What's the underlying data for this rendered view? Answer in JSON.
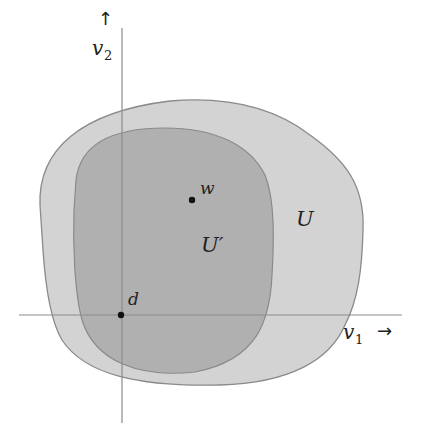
{
  "diagram": {
    "regions": [
      {
        "id": "U",
        "label": "U",
        "fill": "#d2d2d2",
        "stroke": "#8a8a8a"
      },
      {
        "id": "U_prime",
        "label": "U′",
        "fill": "#aeaeae",
        "stroke": "#888888"
      }
    ],
    "points": [
      {
        "id": "w",
        "label": "w"
      },
      {
        "id": "d",
        "label": "d"
      }
    ],
    "axes": {
      "x": {
        "label": "v",
        "subscript": "1",
        "arrow": "→"
      },
      "y": {
        "label": "v",
        "subscript": "2",
        "arrow": "↑"
      },
      "color": "#8c8c8c"
    }
  }
}
